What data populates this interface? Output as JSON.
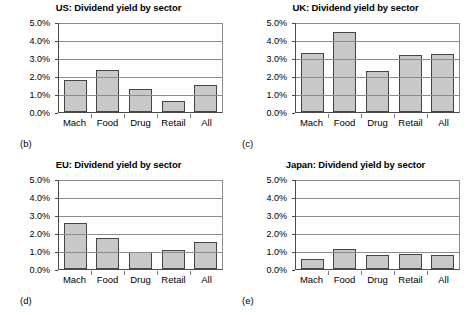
{
  "figure": {
    "panel_labels": {
      "us": "(b)",
      "uk": "(c)",
      "eu": "(d)",
      "japan": "(e)"
    }
  },
  "chart_data": [
    {
      "type": "bar",
      "key": "us",
      "title": "US: Dividend yield by sector",
      "categories": [
        "Mach",
        "Food",
        "Drug",
        "Retail",
        "All"
      ],
      "values": [
        1.8,
        2.35,
        1.3,
        0.6,
        1.5
      ],
      "ytick_labels": [
        "5.0%",
        "4.0%",
        "3.0%",
        "2.0%",
        "1.0%",
        "0.0%"
      ],
      "ytick_values": [
        5.0,
        4.0,
        3.0,
        2.0,
        1.0,
        0.0
      ],
      "ylim": [
        0,
        5
      ],
      "xlabel": "",
      "ylabel": "",
      "grid": true,
      "legend": "none",
      "bar_color": "#c8c8c8",
      "bar_border_color": "#454545"
    },
    {
      "type": "bar",
      "key": "uk",
      "title": "UK: Dividend yield by sector",
      "categories": [
        "Mach",
        "Food",
        "Drug",
        "Retail",
        "All"
      ],
      "values": [
        3.3,
        4.45,
        2.3,
        3.15,
        3.25
      ],
      "ytick_labels": [
        "5.0%",
        "4.0%",
        "3.0%",
        "2.0%",
        "1.0%",
        "0.0%"
      ],
      "ytick_values": [
        5.0,
        4.0,
        3.0,
        2.0,
        1.0,
        0.0
      ],
      "ylim": [
        0,
        5
      ],
      "xlabel": "",
      "ylabel": "",
      "grid": true,
      "legend": "none",
      "bar_color": "#c8c8c8",
      "bar_border_color": "#454545"
    },
    {
      "type": "bar",
      "key": "eu",
      "title": "EU: Dividend yield by sector",
      "categories": [
        "Mach",
        "Food",
        "Drug",
        "Retail",
        "All"
      ],
      "values": [
        2.55,
        1.7,
        0.95,
        1.05,
        1.5
      ],
      "ytick_labels": [
        "5.0%",
        "4.0%",
        "3.0%",
        "2.0%",
        "1.0%",
        "0.0%"
      ],
      "ytick_values": [
        5.0,
        4.0,
        3.0,
        2.0,
        1.0,
        0.0
      ],
      "ylim": [
        0,
        5
      ],
      "xlabel": "",
      "ylabel": "",
      "grid": true,
      "legend": "none",
      "bar_color": "#c8c8c8",
      "bar_border_color": "#454545"
    },
    {
      "type": "bar",
      "key": "japan",
      "title": "Japan: Dividend yield by sector",
      "categories": [
        "Mach",
        "Food",
        "Drug",
        "Retail",
        "All"
      ],
      "values": [
        0.55,
        1.1,
        0.8,
        0.85,
        0.8
      ],
      "ytick_labels": [
        "5.0%",
        "4.0%",
        "3.0%",
        "2.0%",
        "1.0%",
        "0.0%"
      ],
      "ytick_values": [
        5.0,
        4.0,
        3.0,
        2.0,
        1.0,
        0.0
      ],
      "ylim": [
        0,
        5
      ],
      "xlabel": "",
      "ylabel": "",
      "grid": true,
      "legend": "none",
      "bar_color": "#c8c8c8",
      "bar_border_color": "#454545"
    }
  ]
}
